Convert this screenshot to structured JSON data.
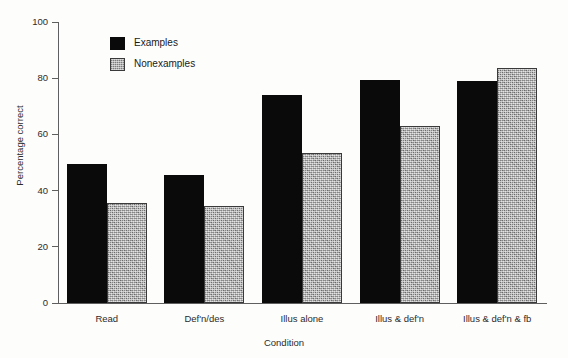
{
  "chart_data": {
    "type": "bar",
    "title": "",
    "xlabel": "Condition",
    "ylabel": "Percentage correct",
    "categories": [
      "Read",
      "Def'n/des",
      "Illus alone",
      "Illus & def'n",
      "Illus & def'n & fb"
    ],
    "series": [
      {
        "name": "Examples",
        "color": "#0a0a0a",
        "values": [
          49.5,
          45.5,
          74.0,
          79.5,
          79.0
        ]
      },
      {
        "name": "Nonexamples",
        "color": "#b0b0b0",
        "values": [
          35.5,
          34.5,
          53.5,
          63.0,
          83.5
        ]
      }
    ],
    "ylim": [
      0,
      100
    ],
    "yticks": [
      0,
      20,
      40,
      60,
      80,
      100
    ],
    "ytick_labels": [
      "0",
      "20",
      "40",
      "60",
      "80",
      "100"
    ],
    "grid": false,
    "legend_position": "upper-left-inside"
  }
}
